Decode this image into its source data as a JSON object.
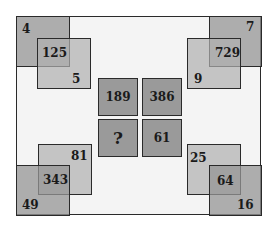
{
  "puzzle": {
    "top_left": {
      "outer": "4",
      "center": "125",
      "inner": "5"
    },
    "top_right": {
      "outer": "7",
      "center": "729",
      "inner": "9"
    },
    "bottom_left": {
      "outer": "49",
      "center": "343",
      "inner": "81"
    },
    "bottom_right": {
      "outer": "16",
      "center": "64",
      "inner": "25"
    },
    "center_grid": [
      "189",
      "386",
      "?",
      "61"
    ]
  },
  "colors": {
    "square_dark": "#969696",
    "square_light": "#b0b0b0",
    "background": "#f4f4f4",
    "border": "#2a2a2a"
  }
}
